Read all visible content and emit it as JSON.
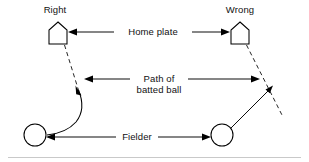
{
  "figure": {
    "background_color": "#ffffff",
    "ink_color": "#000000",
    "width": 309,
    "height": 162
  },
  "labels": {
    "left_heading": "Right",
    "right_heading": "Wrong",
    "home_plate": "Home plate",
    "path_line1": "Path of",
    "path_line2": "batted ball",
    "fielder": "Fielder"
  },
  "callouts": [
    {
      "name": "home-plate",
      "text": "Home plate",
      "arrow_left": true,
      "arrow_right": true,
      "y": 32
    },
    {
      "name": "path-of-batted-ball",
      "text": "Path of batted ball",
      "arrow_left": true,
      "arrow_right": true,
      "y": 79
    },
    {
      "name": "fielder",
      "text": "Fielder",
      "arrow_left": true,
      "arrow_right": true,
      "y": 137
    }
  ],
  "diagram_elements": {
    "left_panel": {
      "heading": "Right",
      "home_plate_shape": "pentagon-point-up",
      "home_plate_position": [
        58,
        34
      ],
      "fielder_shape": "circle",
      "fielder_position": [
        35,
        135
      ],
      "foul_line_style": "dashed",
      "ball_path_style": "solid-curved",
      "ball_path_description": "curves away from the foul line and hooks to the fielder"
    },
    "right_panel": {
      "heading": "Wrong",
      "home_plate_shape": "pentagon-point-up",
      "home_plate_position": [
        240,
        34
      ],
      "fielder_shape": "circle",
      "fielder_position": [
        222,
        135
      ],
      "foul_line_style": "dashed",
      "ball_path_style": "solid-straight",
      "ball_path_description": "straight line from the fielder intersecting the foul line"
    }
  }
}
